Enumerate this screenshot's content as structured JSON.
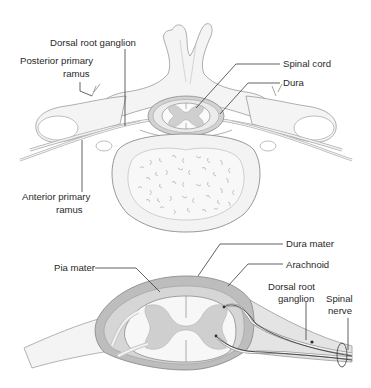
{
  "figure": {
    "top_panel": {
      "title": "Transverse section of vertebra with spinal cord and nerve roots",
      "labels": {
        "dorsal_root_ganglion": "Dorsal root ganglion",
        "posterior_primary_ramus_line1": "Posterior primary",
        "posterior_primary_ramus_line2": "ramus",
        "spinal_cord": "Spinal cord",
        "dura": "Dura",
        "anterior_primary_ramus_line1": "Anterior primary",
        "anterior_primary_ramus_line2": "ramus"
      }
    },
    "bottom_panel": {
      "title": "Meningeal coverings of spinal cord and nerve root",
      "labels": {
        "dura_mater": "Dura mater",
        "pia_mater": "Pia mater",
        "arachnoid": "Arachnoid",
        "dorsal_root_ganglion_line1": "Dorsal root",
        "dorsal_root_ganglion_line2": "ganglion",
        "spinal_nerve_line1": "Spinal",
        "spinal_nerve_line2": "nerve"
      }
    },
    "colors": {
      "background": "#ffffff",
      "bone": "#f2f2f2",
      "bone_outline": "#9a9a9a",
      "dura_dark": "#b4b4b4",
      "csf_light": "#ededed",
      "grey_matter": "#cfcfcf",
      "white_matter": "#f7f7f7",
      "label_text": "#2a2a2a"
    }
  }
}
